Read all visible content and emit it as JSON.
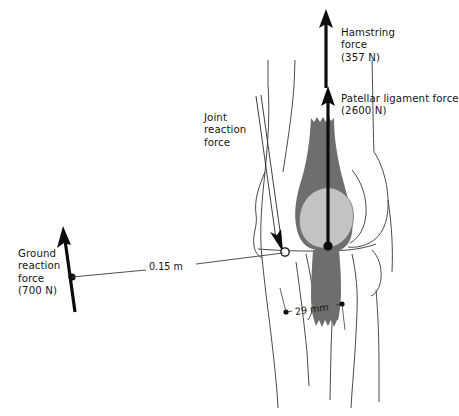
{
  "figure": {
    "background_color": "#ffffff",
    "width": 459,
    "height": 416
  },
  "colors": {
    "outline": "#4a4a4a",
    "arrow": "#0d0d0d",
    "tendon_fill": "#6e6e6e",
    "patella_fill": "#c3c3c3",
    "text": "#141414",
    "dimension_line": "#3c3c3c"
  },
  "labels": {
    "hamstring": "Hamstring\nforce\n(357 N)",
    "patellar": "Patellar ligament force\n(2600 N)",
    "joint": "Joint\nreaction\nforce",
    "ground": "Ground\nreaction\nforce\n(700 N)"
  },
  "dimensions": {
    "moment_arm_grf": "0.15 m",
    "moment_arm_patellar": "29 mm"
  },
  "forces": [
    {
      "name": "hamstring-force",
      "label": "Hamstring force",
      "magnitude": "357 N",
      "value": 357,
      "unit": "N",
      "direction": "up"
    },
    {
      "name": "patellar-ligament-force",
      "label": "Patellar ligament force",
      "magnitude": "2600 N",
      "value": 2600,
      "unit": "N",
      "direction": "up"
    },
    {
      "name": "joint-reaction-force",
      "label": "Joint reaction force",
      "magnitude": "",
      "value": null,
      "unit": "",
      "direction": "down-right"
    },
    {
      "name": "ground-reaction-force",
      "label": "Ground reaction force",
      "magnitude": "700 N",
      "value": 700,
      "unit": "N",
      "direction": "up"
    }
  ],
  "anatomy": [
    {
      "name": "femur",
      "label": "Femur"
    },
    {
      "name": "patella",
      "label": "Patella"
    },
    {
      "name": "quadriceps-tendon",
      "label": "Quadriceps tendon"
    },
    {
      "name": "patellar-ligament",
      "label": "Patellar ligament"
    },
    {
      "name": "tibia",
      "label": "Tibia"
    },
    {
      "name": "fibula",
      "label": "Fibula"
    }
  ]
}
